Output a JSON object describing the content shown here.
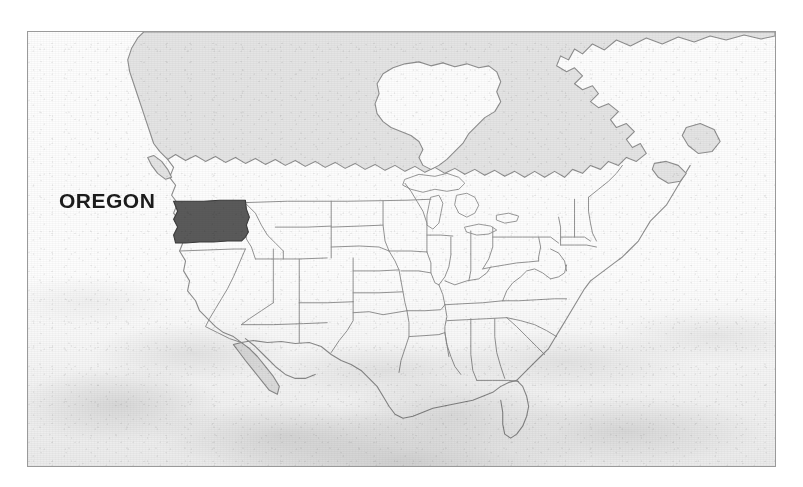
{
  "map": {
    "title": "Oregon Locator Map",
    "region": "North America",
    "highlighted_state": "OREGON",
    "label_text": "OREGON",
    "frame": {
      "x": 27,
      "y": 31,
      "width": 749,
      "height": 436,
      "border_color": "#9a9a9a"
    },
    "colors": {
      "background": "#fbfbfb",
      "ocean": "#fdfdfd",
      "land_fill": "#e4e4e4",
      "land_stroke": "#8e8e8e",
      "state_border": "#8e8e8e",
      "highlight_fill": "#5a5a5a",
      "highlight_stroke": "#3a3a3a",
      "label_color": "#1b1b1b",
      "frame_border": "#9a9a9a",
      "page_background": "#ffffff"
    },
    "texture": {
      "style": "scanned-paper",
      "heavier_region": "bottom"
    },
    "features": {
      "canada_label": "",
      "mexico_label": "",
      "water_bodies": [
        "Hudson Bay",
        "Great Lakes",
        "Gulf of Mexico",
        "Gulf of California"
      ],
      "landmarks": [
        "Baja California",
        "Florida Peninsula",
        "Vancouver Island",
        "Nova Scotia"
      ]
    }
  }
}
